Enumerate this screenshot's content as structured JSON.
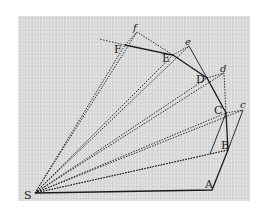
{
  "diagram": {
    "title": "",
    "points": {
      "S": {
        "label": "S",
        "x": 35,
        "y": 193
      },
      "A": {
        "label": "A",
        "x": 212,
        "y": 190
      },
      "B": {
        "label": "B",
        "x": 228,
        "y": 150
      },
      "C": {
        "label": "C",
        "x": 226,
        "y": 113
      },
      "D": {
        "label": "D",
        "x": 207,
        "y": 78
      },
      "E": {
        "label": "E",
        "x": 173,
        "y": 55
      },
      "F": {
        "label": "F",
        "x": 125,
        "y": 45
      },
      "c": {
        "label": "c",
        "x": 243,
        "y": 110
      },
      "d": {
        "label": "d",
        "x": 224,
        "y": 73
      },
      "e": {
        "label": "e",
        "x": 189,
        "y": 46
      },
      "f": {
        "label": "f",
        "x": 137,
        "y": 32
      }
    },
    "colors": {
      "background": "#d9d9d9",
      "ink": "#1a1a1a"
    }
  }
}
